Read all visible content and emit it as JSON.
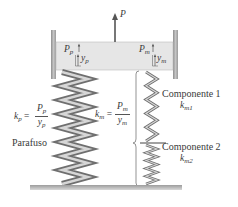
{
  "diagram": {
    "force_label": "P",
    "bolt": {
      "force_label": "P",
      "force_sub": "p",
      "deflection_label": "y",
      "deflection_sub": "p",
      "stiffness_symbol": "k",
      "stiffness_sub": "p",
      "equation_num": "P",
      "equation_num_sub": "p",
      "equation_den": "y",
      "equation_den_sub": "p",
      "name": "Parafuso"
    },
    "members": {
      "force_label": "P",
      "force_sub": "m",
      "deflection_label": "y",
      "deflection_sub": "m",
      "stiffness_symbol": "k",
      "stiffness_sub": "m",
      "equation_num": "P",
      "equation_num_sub": "m",
      "equation_den": "y",
      "equation_den_sub": "m",
      "components": [
        {
          "name": "Componente 1",
          "stiffness_symbol": "k",
          "stiffness_sub": "m1"
        },
        {
          "name": "Componente 2",
          "stiffness_symbol": "k",
          "stiffness_sub": "m2"
        }
      ]
    },
    "equals": "="
  },
  "colors": {
    "plate": "#e4e4e4",
    "wall": "#a8a8a8",
    "spring_dark": "#6f6f6f",
    "spring_light": "#d6d6d6",
    "floor": "#b8b8b8",
    "line": "#555555"
  }
}
